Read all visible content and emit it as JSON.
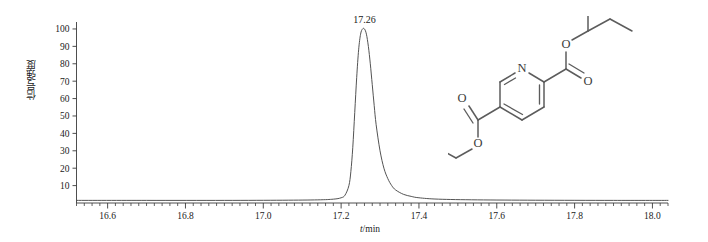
{
  "figure": {
    "name": "chromatogram",
    "y_axis_title": "信号强度",
    "x_axis_title_variable": "t",
    "x_axis_title_unit": "/min",
    "peak_label": "17.26"
  },
  "chart_data": {
    "type": "line",
    "title": "",
    "subtitle": "",
    "xlabel": "t/min",
    "ylabel": "信号强度",
    "xlim": [
      16.52,
      18.04
    ],
    "ylim": [
      0,
      104
    ],
    "grid": false,
    "legend": null,
    "x_ticks": [
      "16.6",
      "16.8",
      "17.0",
      "17.2",
      "17.4",
      "17.6",
      "17.8",
      "18.0"
    ],
    "x_tick_values": [
      16.6,
      16.8,
      17.0,
      17.2,
      17.4,
      17.6,
      17.8,
      18.0
    ],
    "x_minor_tick_step": 0.02,
    "y_ticks": [
      "10",
      "20",
      "30",
      "40",
      "50",
      "60",
      "70",
      "80",
      "90",
      "100"
    ],
    "y_tick_values": [
      10,
      20,
      30,
      40,
      50,
      60,
      70,
      80,
      90,
      100
    ],
    "annotations": [
      {
        "text": "17.26",
        "x": 17.26,
        "y": 100,
        "name": "peak-retention-time-label"
      }
    ],
    "series": [
      {
        "name": "signal",
        "peak_retention_time": 17.26,
        "peak_height": 100,
        "baseline": 1.5,
        "x": [
          16.52,
          16.7,
          16.9,
          17.05,
          17.14,
          17.18,
          17.2,
          17.21,
          17.22,
          17.225,
          17.23,
          17.235,
          17.24,
          17.245,
          17.25,
          17.255,
          17.26,
          17.265,
          17.27,
          17.275,
          17.28,
          17.285,
          17.29,
          17.3,
          17.31,
          17.32,
          17.33,
          17.34,
          17.36,
          17.38,
          17.4,
          17.45,
          17.55,
          17.7,
          17.9,
          18.04
        ],
        "y": [
          1.5,
          1.5,
          1.5,
          1.6,
          1.8,
          2.2,
          3.0,
          4.5,
          10.0,
          18.0,
          32.0,
          52.0,
          72.0,
          88.0,
          97.0,
          100.0,
          100.0,
          97.0,
          90.0,
          80.0,
          68.0,
          56.0,
          45.0,
          30.0,
          20.0,
          14.0,
          10.0,
          7.5,
          5.0,
          3.8,
          3.0,
          2.2,
          1.8,
          1.6,
          1.5,
          1.5
        ]
      }
    ]
  },
  "structure": {
    "name": "dipropyl-pyridine-2,5-dicarboxylate",
    "atom_labels": [
      {
        "id": "ring-nitrogen",
        "text": "N"
      },
      {
        "id": "ester-upper-single-bonded-oxygen",
        "text": "O"
      },
      {
        "id": "ester-upper-carbonyl-oxygen",
        "text": "O"
      },
      {
        "id": "ester-lower-carbonyl-oxygen",
        "text": "O"
      },
      {
        "id": "ester-lower-single-bonded-oxygen",
        "text": "O"
      }
    ]
  }
}
